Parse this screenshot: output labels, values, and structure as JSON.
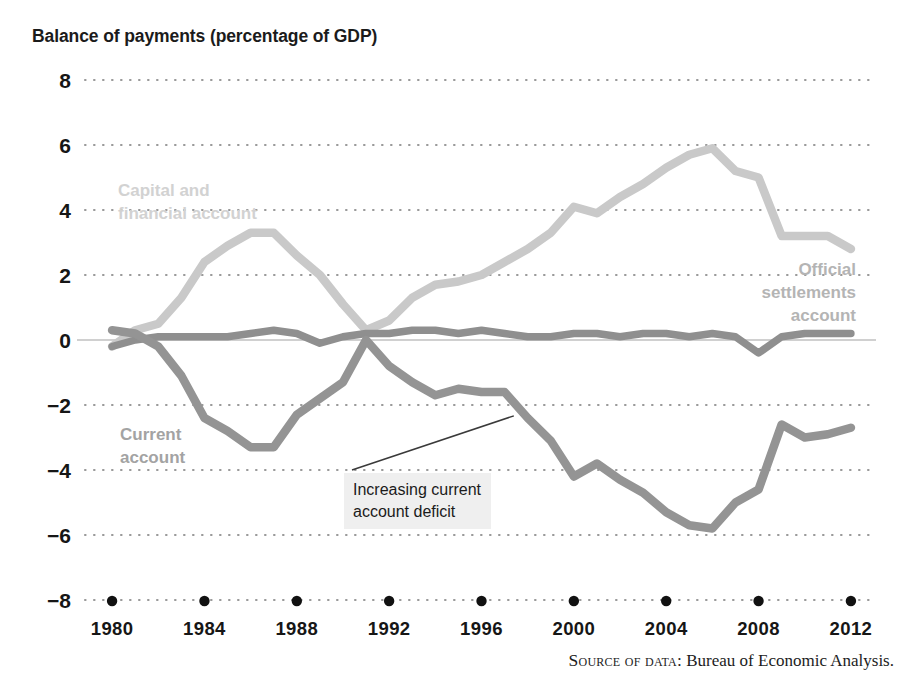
{
  "figure": {
    "title": "Balance of payments (percentage of GDP)",
    "source_prefix": "Source of data:",
    "source_text": " Bureau of Economic Analysis."
  },
  "annotation": {
    "text": "Increasing current\naccount deficit",
    "target_year": 1997.4,
    "target_value": -2.15
  },
  "labels": {
    "capital": {
      "line1": "Capital and",
      "line2": "financial account"
    },
    "current": {
      "line1": "Current",
      "line2": "account"
    },
    "official": {
      "line1": "Official",
      "line2": "settlements",
      "line3": "account"
    }
  },
  "colors": {
    "capital": "#c9c9c9",
    "current": "#949494",
    "official": "#8f8f8f",
    "grid": "#9a9a9a",
    "zero_axis": "#c0c0c0",
    "text": "#161616",
    "annotation_bg": "#efefef"
  },
  "chart_data": {
    "type": "line",
    "title": "Balance of payments (percentage of GDP)",
    "xlabel": "",
    "ylabel": "percentage of GDP",
    "xlim": [
      1979,
      2013
    ],
    "ylim": [
      -8,
      8
    ],
    "yticks": [
      8,
      6,
      4,
      2,
      0,
      -2,
      -4,
      -6,
      -8
    ],
    "ytick_labels": [
      "8",
      "6",
      "4",
      "2",
      "0",
      "−2",
      "−4",
      "−6",
      "−8"
    ],
    "xticks": [
      1980,
      1984,
      1988,
      1992,
      1996,
      2000,
      2004,
      2008,
      2012
    ],
    "xtick_labels": [
      "1980",
      "1984",
      "1988",
      "1992",
      "1996",
      "2000",
      "2004",
      "2008",
      "2012"
    ],
    "xtick_marker": "dot",
    "grid": true,
    "grid_style": "dotted",
    "legend": "inline-labels",
    "x": [
      1980,
      1981,
      1982,
      1983,
      1984,
      1985,
      1986,
      1987,
      1988,
      1989,
      1990,
      1991,
      1992,
      1993,
      1994,
      1995,
      1996,
      1997,
      1998,
      1999,
      2000,
      2001,
      2002,
      2003,
      2004,
      2005,
      2006,
      2007,
      2008,
      2009,
      2010,
      2011,
      2012
    ],
    "series": [
      {
        "name": "Capital and financial account",
        "color": "#c9c9c9",
        "values": [
          -0.2,
          0.3,
          0.5,
          1.3,
          2.4,
          2.9,
          3.3,
          3.3,
          2.6,
          2.0,
          1.1,
          0.3,
          0.6,
          1.3,
          1.7,
          1.8,
          2.0,
          2.4,
          2.8,
          3.3,
          4.1,
          3.9,
          4.4,
          4.8,
          5.3,
          5.7,
          5.9,
          5.2,
          5.0,
          3.2,
          3.2,
          3.2,
          2.8
        ]
      },
      {
        "name": "Current account",
        "color": "#949494",
        "values": [
          0.3,
          0.2,
          -0.2,
          -1.1,
          -2.4,
          -2.8,
          -3.3,
          -3.3,
          -2.3,
          -1.8,
          -1.3,
          0.0,
          -0.8,
          -1.3,
          -1.7,
          -1.5,
          -1.6,
          -1.6,
          -2.4,
          -3.1,
          -4.2,
          -3.8,
          -4.3,
          -4.7,
          -5.3,
          -5.7,
          -5.8,
          -5.0,
          -4.6,
          -2.6,
          -3.0,
          -2.9,
          -2.7
        ]
      },
      {
        "name": "Official settlements account",
        "color": "#8f8f8f",
        "values": [
          -0.2,
          0.0,
          0.1,
          0.1,
          0.1,
          0.1,
          0.2,
          0.3,
          0.2,
          -0.1,
          0.1,
          0.2,
          0.2,
          0.3,
          0.3,
          0.2,
          0.3,
          0.2,
          0.1,
          0.1,
          0.2,
          0.2,
          0.1,
          0.2,
          0.2,
          0.1,
          0.2,
          0.1,
          -0.4,
          0.1,
          0.2,
          0.2,
          0.2
        ]
      }
    ],
    "annotations": [
      {
        "text": "Increasing current account deficit",
        "points_to": "Current account"
      }
    ]
  }
}
